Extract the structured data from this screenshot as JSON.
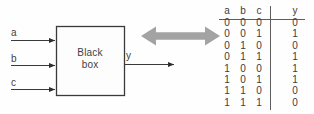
{
  "figure": {
    "diagram": {
      "box_title_line1": "Black",
      "box_title_line2": "box",
      "input_labels": [
        "a",
        "b",
        "c"
      ],
      "output_label": "y",
      "equivalence_arrow_icon": "double-headed-arrow-icon",
      "line_color": "#3a3a3a",
      "box_fill": "#fdfdfd",
      "arrow_fill": "#a0a0a0"
    },
    "truth_table": {
      "headers": [
        "a",
        "b",
        "c",
        "y"
      ],
      "rows": [
        [
          "0",
          "0",
          "0",
          "0"
        ],
        [
          "0",
          "0",
          "1",
          "1"
        ],
        [
          "0",
          "1",
          "0",
          "0"
        ],
        [
          "0",
          "1",
          "1",
          "1"
        ],
        [
          "1",
          "0",
          "0",
          "1"
        ],
        [
          "1",
          "0",
          "1",
          "1"
        ],
        [
          "1",
          "1",
          "0",
          "0"
        ],
        [
          "1",
          "1",
          "1",
          "0"
        ]
      ]
    }
  }
}
